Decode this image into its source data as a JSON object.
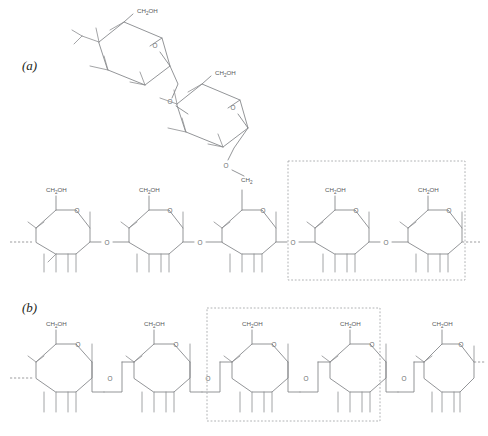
{
  "figure": {
    "background_color": "#ffffff",
    "bond_color": "#808285",
    "label_color": "#58595b",
    "highlight_box_color": "#a7a9ac",
    "width": 488,
    "height": 436
  },
  "panels": [
    {
      "id": "a",
      "label": "(a)",
      "label_x": 22,
      "label_y": 70,
      "description": "Branched chain: main horizontal backbone of five glucose rings with a two-ring branch rising from the third ring",
      "highlight_box": {
        "x": 288,
        "y": 161,
        "width": 177,
        "height": 119
      }
    },
    {
      "id": "b",
      "label": "(b)",
      "label_x": 22,
      "label_y": 312,
      "description": "Linear chain of four glucose rings joined by stepped oxygen bridges",
      "highlight_box": {
        "x": 207,
        "y": 308,
        "width": 173,
        "height": 113
      }
    }
  ],
  "labels": {
    "ch2oh": "CH",
    "ch2oh_sub": "2",
    "ch2oh_tail": "OH",
    "ch2": "CH",
    "ch2_sub": "2",
    "oxygen": "O"
  },
  "chain_a": {
    "main_rings": [
      {
        "index": 1,
        "cx": 62,
        "cy": 228,
        "top_label": "CH2OH"
      },
      {
        "index": 2,
        "cx": 155,
        "cy": 228,
        "top_label": "CH2OH"
      },
      {
        "index": 3,
        "cx": 248,
        "cy": 228,
        "top_label": "CH2"
      },
      {
        "index": 4,
        "cx": 341,
        "cy": 228,
        "top_label": "CH2OH"
      },
      {
        "index": 5,
        "cx": 434,
        "cy": 228,
        "top_label": "CH2OH"
      }
    ],
    "branch_rings": [
      {
        "index": 1,
        "cx": 127,
        "cy": 58,
        "top_label": "CH2OH",
        "rotation": -40
      },
      {
        "index": 2,
        "cx": 205,
        "cy": 120,
        "top_label": "CH2OH",
        "rotation": -40
      }
    ],
    "linkage_oxygens": [
      {
        "x": 108,
        "y": 242
      },
      {
        "x": 201,
        "y": 242
      },
      {
        "x": 294,
        "y": 242
      },
      {
        "x": 387,
        "y": 242
      }
    ],
    "branch_oxygens": [
      {
        "x": 173,
        "y": 101
      },
      {
        "x": 228,
        "y": 166
      }
    ],
    "left_terminus_dashed": true,
    "right_terminus_dashed": true
  },
  "chain_b": {
    "rings": [
      {
        "index": 1,
        "cx": 62,
        "cy": 365,
        "top_label": "CH2OH"
      },
      {
        "index": 2,
        "cx": 160,
        "cy": 365,
        "top_label": "CH2OH"
      },
      {
        "index": 3,
        "cx": 258,
        "cy": 365,
        "top_label": "CH2OH"
      },
      {
        "index": 4,
        "cx": 356,
        "cy": 365,
        "top_label": "CH2OH"
      },
      {
        "index": 5,
        "cx": 441,
        "cy": 365,
        "top_label": "CH2OH"
      }
    ],
    "linkage_oxygens": [
      {
        "x": 110,
        "y": 378
      },
      {
        "x": 208,
        "y": 378
      },
      {
        "x": 306,
        "y": 378
      },
      {
        "x": 404,
        "y": 378
      }
    ],
    "left_terminus_dashed": true,
    "right_terminus_dashed": true
  }
}
